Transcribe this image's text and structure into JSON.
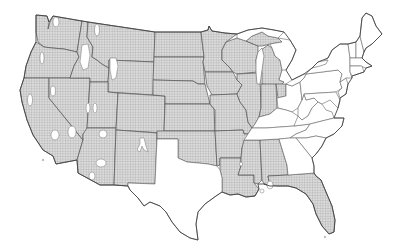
{
  "map": {
    "subject": "Contiguous United States",
    "legend": [],
    "colors": {
      "background": "#ffffff",
      "hatch_fill": "#d4d4d4",
      "hatch_line": "#9a9a9a",
      "border": "#555555",
      "unshaded": "#ffffff"
    },
    "pattern": "grid-hatch",
    "hatched_regions": [
      "Washington",
      "Oregon",
      "California",
      "Nevada",
      "Idaho",
      "Montana",
      "Wyoming",
      "Utah",
      "Arizona",
      "Colorado",
      "New Mexico",
      "North Dakota",
      "South Dakota",
      "Nebraska",
      "Kansas",
      "Oklahoma",
      "Minnesota",
      "Iowa",
      "Missouri",
      "Arkansas",
      "Louisiana",
      "Wisconsin",
      "Illinois",
      "Michigan",
      "Indiana",
      "Mississippi",
      "Alabama",
      "Florida"
    ],
    "unshaded_regions": [
      "Texas",
      "Ohio",
      "Kentucky",
      "Tennessee",
      "Georgia",
      "South Carolina",
      "North Carolina",
      "Virginia",
      "West Virginia",
      "Pennsylvania",
      "New York",
      "Maryland",
      "New Jersey",
      "Delaware",
      "Connecticut",
      "Rhode Island",
      "Massachusetts",
      "Vermont",
      "New Hampshire",
      "Maine"
    ],
    "notes": "White islands within hatched area in western states (mountain/desert areas)"
  }
}
